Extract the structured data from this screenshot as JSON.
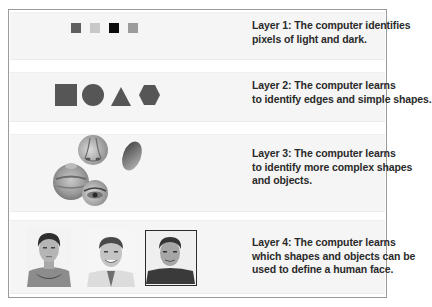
{
  "layers": [
    {
      "caption_lines": [
        "Layer 1: The computer identifies",
        "pixels of light and dark."
      ],
      "visual": "pixel-squares",
      "pixels": [
        "#5e5e5e",
        "#c8c8c8",
        "#0c0c0c",
        "#9c9c9c"
      ]
    },
    {
      "caption_lines": [
        "Layer 2: The computer learns",
        "to identify edges and simple shapes."
      ],
      "visual": "simple-shapes",
      "shapes": [
        "square",
        "circle",
        "triangle",
        "hexagon"
      ],
      "shape_color": "#565656"
    },
    {
      "caption_lines": [
        "Layer 3: The computer learns",
        "to identify more complex shapes",
        "and objects."
      ],
      "visual": "facial-features",
      "features": [
        "nose",
        "cheek",
        "lips",
        "eye"
      ]
    },
    {
      "caption_lines": [
        "Layer 4: The computer learns",
        "which shapes and objects can be",
        "used to define a human face."
      ],
      "visual": "face-photos",
      "faces": [
        "face-photo-young-man",
        "face-photo-smiling-man",
        "face-photo-framed-man"
      ]
    }
  ]
}
